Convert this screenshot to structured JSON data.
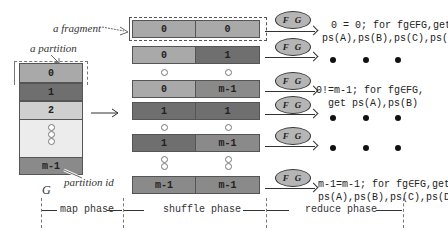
{
  "labels": {
    "fragment": "a fragment",
    "partition": "a partition",
    "partition_id": "partition id",
    "graph": "G"
  },
  "partitions": [
    {
      "id": "0",
      "shade": "light"
    },
    {
      "id": "1",
      "shade": "dark"
    },
    {
      "id": "2",
      "shade": "pale"
    },
    {
      "id": "m-1",
      "shade": "mid"
    }
  ],
  "fragments": [
    {
      "left": "0",
      "right": "0"
    },
    {
      "left": "0",
      "right": "1"
    },
    {
      "left": "0",
      "right": "m-1"
    },
    {
      "left": "1",
      "right": "1"
    },
    {
      "left": "1",
      "right": "m-1"
    },
    {
      "left": "m-1",
      "right": "m-1"
    }
  ],
  "fg_label": "F G",
  "results": [
    {
      "line1": "0 = 0; for fg∈FG,get",
      "line2": "ps(A),ps(B),ps(C),ps(D)"
    },
    {
      "line1": "0!=m-1; for fg∈FG,",
      "line2": "get ps(A),ps(B)"
    },
    {
      "line1": "m-1=m-1; for fg∈FG,get",
      "line2": "ps(A),ps(B),ps(C),ps(D)"
    }
  ],
  "phases": {
    "map": "map phase",
    "shuffle": "shuffle phase",
    "reduce": "reduce phase"
  }
}
